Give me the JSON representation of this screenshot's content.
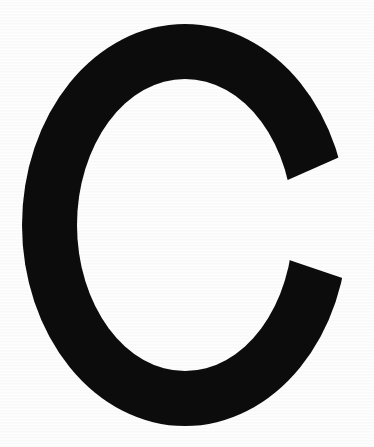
{
  "image": {
    "kind": "letterform-specimen",
    "character": "C",
    "description": "Uppercase letter C rendered as a solid black serif-less glyph on a white background",
    "width_px": 374,
    "height_px": 447
  },
  "colors": {
    "background": "#fefefe",
    "glyph": "#0d0c0c"
  },
  "glyph": {
    "label": "C",
    "case": "uppercase",
    "fill_color": "#0d0c0c",
    "bounding_box": {
      "left_px": 22,
      "top_px": 24,
      "right_px": 348,
      "bottom_px": 426,
      "width_px": 326,
      "height_px": 402
    },
    "stroke_weight_px": 55,
    "counter": {
      "shape": "oval",
      "fill_color": "#fefefe"
    },
    "terminals": {
      "upper_right": {
        "cut": "diagonal",
        "x_px": 348,
        "y_px": 144
      },
      "lower_right": {
        "cut": "diagonal",
        "x_px": 348,
        "y_px": 286
      }
    },
    "path": "M 348 140 L 290 158 C 280 118 261 90 235 72 C 209 54 178 45 143 45 C 109 45 82 57 62 81 C 42 105 32 139 32 183 L 32 268 C 32 311 42 345 62 369 C 82 393 109 405 143 405 C 178 405 209 396 235 378 C 261 360 280 331 291 292 L 348 310 C 334 361 309 399 274 423 C 239 447 198 459 150 459 C 110 459 75 449 46 430 C 17 411 -5 384 -21 348 C -37 312 -45 271 -45 225 C -45 179 -37 138 -21 102 C -5 66 17 39 46 20 C 75 1 110 -9 150 -9 C 198 -9 239 3 274 27 C 309 51 334 89 348 140 Z"
  }
}
